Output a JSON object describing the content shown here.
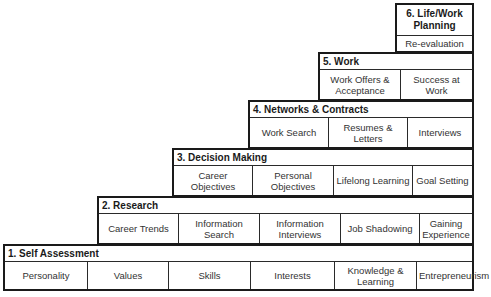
{
  "diagram": {
    "type": "staircase",
    "steps": [
      {
        "title": "1. Self Assessment",
        "items": [
          "Personality",
          "Values",
          "Skills",
          "Interests",
          "Knowledge & Learning",
          "Entrepreneurism"
        ]
      },
      {
        "title": "2. Research",
        "items": [
          "Career Trends",
          "Information Search",
          "Information Interviews",
          "Job Shadowing",
          "Gaining Experience"
        ]
      },
      {
        "title": "3. Decision Making",
        "items": [
          "Career Objectives",
          "Personal Objectives",
          "Lifelong Learning",
          "Goal Setting"
        ]
      },
      {
        "title": "4. Networks & Contracts",
        "items": [
          "Work Search",
          "Resumes & Letters",
          "Interviews"
        ]
      },
      {
        "title": "5. Work",
        "items": [
          "Work Offers & Acceptance",
          "Success at Work"
        ]
      },
      {
        "title": "6. Life/Work Planning",
        "items": [
          "Re-evaluation"
        ]
      }
    ]
  },
  "colors": {
    "border": "#1a1a1a",
    "text": "#333333",
    "background": "#ffffff"
  }
}
